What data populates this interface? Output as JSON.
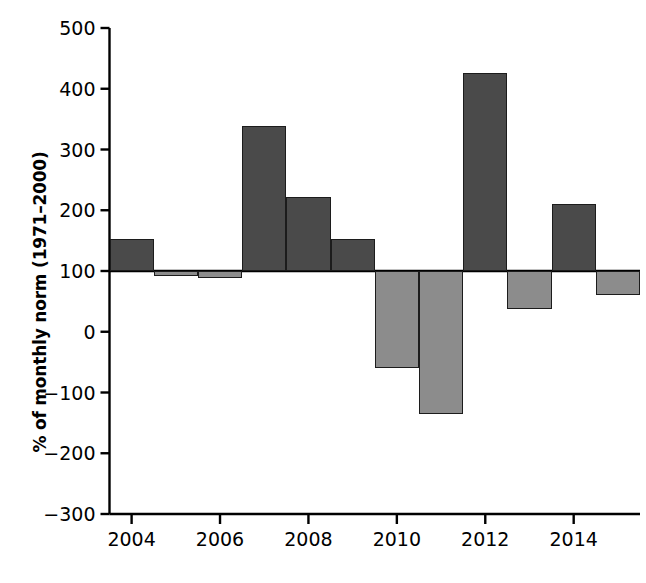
{
  "chart_data": {
    "type": "bar",
    "title": "",
    "xlabel": "",
    "ylabel": "% of monthly norm (1971–2000)",
    "ylim": [
      -300,
      500
    ],
    "xlim": [
      2003.5,
      2015.5
    ],
    "baseline": 100,
    "grid": false,
    "legend": null,
    "ytick_labels": [
      "500",
      "400",
      "300",
      "200",
      "100",
      "0",
      "−100",
      "−200",
      "−300"
    ],
    "ytick_values": [
      500,
      400,
      300,
      200,
      100,
      0,
      -100,
      -200,
      -300
    ],
    "xtick_labels": [
      "2004",
      "2006",
      "2008",
      "2010",
      "2012",
      "2014"
    ],
    "xtick_values": [
      2004,
      2006,
      2008,
      2010,
      2012,
      2014
    ],
    "categories": [
      2004,
      2005,
      2006,
      2007,
      2008,
      2009,
      2010,
      2011,
      2012,
      2013,
      2014,
      2015
    ],
    "values": [
      152,
      91,
      88,
      339,
      222,
      153,
      -60,
      -136,
      426,
      38,
      211,
      60
    ],
    "colors": {
      "above_baseline": "#4a4a4a",
      "below_baseline": "#8c8c8c",
      "bar_edge": "#1c1c1c",
      "axis": "#000000",
      "background": "#ffffff"
    },
    "bars": [
      {
        "year": 2004,
        "value": 152,
        "shade": "dark"
      },
      {
        "year": 2005,
        "value": 91,
        "shade": "light"
      },
      {
        "year": 2006,
        "value": 88,
        "shade": "light"
      },
      {
        "year": 2007,
        "value": 339,
        "shade": "dark"
      },
      {
        "year": 2008,
        "value": 222,
        "shade": "dark"
      },
      {
        "year": 2009,
        "value": 153,
        "shade": "dark"
      },
      {
        "year": 2010,
        "value": -60,
        "shade": "light"
      },
      {
        "year": 2011,
        "value": -136,
        "shade": "light"
      },
      {
        "year": 2012,
        "value": 426,
        "shade": "dark"
      },
      {
        "year": 2013,
        "value": 38,
        "shade": "light"
      },
      {
        "year": 2014,
        "value": 211,
        "shade": "dark"
      },
      {
        "year": 2015,
        "value": 60,
        "shade": "light"
      }
    ]
  }
}
